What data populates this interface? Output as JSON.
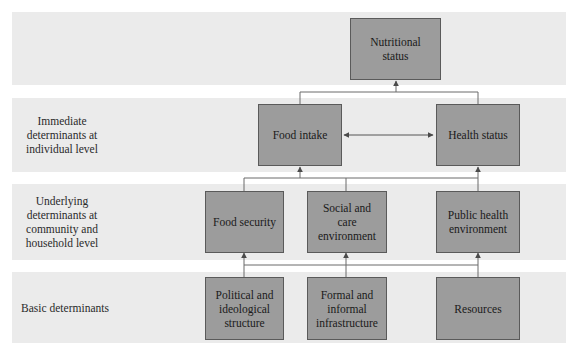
{
  "diagram": {
    "colors": {
      "band_background": "#ebebeb",
      "node_fill": "#9c9c9c",
      "node_border": "#5a5a5a",
      "connector": "#6a6a6a"
    },
    "levels": [
      {
        "id": "outcome",
        "label": ""
      },
      {
        "id": "immediate",
        "label": "Immediate determinants at individual level"
      },
      {
        "id": "underlying",
        "label": "Underlying determinants at community and household level"
      },
      {
        "id": "basic",
        "label": "Basic determinants"
      }
    ],
    "nodes": {
      "nutritional_status": "Nutritional status",
      "food_intake": "Food intake",
      "health_status": "Health status",
      "food_security": "Food security",
      "social_care_environment": "Social and care environment",
      "public_health_environment": "Public health environment",
      "political_ideological_structure": "Political and ideological structure",
      "formal_informal_infrastructure": "Formal and informal infrastructure",
      "resources": "Resources"
    },
    "edges": [
      {
        "from": "food_intake",
        "to": "nutritional_status",
        "type": "arrow"
      },
      {
        "from": "health_status",
        "to": "nutritional_status",
        "type": "arrow"
      },
      {
        "from": "food_intake",
        "to": "health_status",
        "type": "bidirectional"
      },
      {
        "from": "food_security",
        "to": "food_intake",
        "type": "arrow"
      },
      {
        "from": "social_care_environment",
        "to": "food_intake",
        "type": "arrow"
      },
      {
        "from": "public_health_environment",
        "to": "health_status",
        "type": "arrow"
      },
      {
        "from": "political_ideological_structure",
        "to": "food_security",
        "type": "arrow"
      },
      {
        "from": "formal_informal_infrastructure",
        "to": "social_care_environment",
        "type": "arrow"
      },
      {
        "from": "resources",
        "to": "public_health_environment",
        "type": "arrow"
      }
    ]
  }
}
